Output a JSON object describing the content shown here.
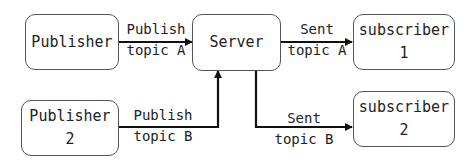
{
  "nodes": {
    "publisher1": {
      "line1": "Publisher",
      "line2": ""
    },
    "server": {
      "line1": "Server"
    },
    "subscriber1": {
      "line1": "subscriber",
      "line2": "1"
    },
    "publisher2": {
      "line1": "Publisher",
      "line2": "2"
    },
    "subscriber2": {
      "line1": "subscriber",
      "line2": "2"
    }
  },
  "edges": {
    "pub1_to_server": {
      "line1": "Publish",
      "line2": "topic A"
    },
    "server_to_sub1": {
      "line1": "Sent",
      "line2": "topic A"
    },
    "pub2_to_server": {
      "line1": "Publish",
      "line2": "topic B"
    },
    "server_to_sub2": {
      "line1": "Sent",
      "line2": "topic B"
    }
  }
}
